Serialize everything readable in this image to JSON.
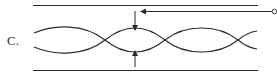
{
  "figure": {
    "label": "C.",
    "colors": {
      "stroke": "#2a2a2a",
      "background": "#ffffff"
    },
    "elements": {
      "top_boundary": "top-wall-line",
      "bottom_boundary": "bottom-wall-line",
      "input_arrow": "horizontal-arrow-with-source-circle",
      "top_probe_arrow": "down-arrow",
      "bottom_probe_arrow": "up-arrow",
      "waves": "two-interleaved-sinusoids"
    }
  }
}
